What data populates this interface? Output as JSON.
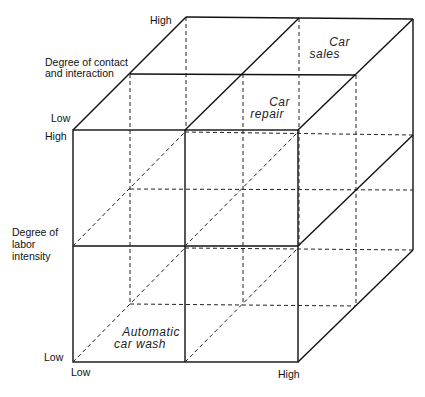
{
  "diagram": {
    "type": "3d-cube-matrix",
    "axes": {
      "depth": {
        "title": "Degree of contact\nand interaction",
        "title_line1": "Degree of contact",
        "title_line2": "and interaction",
        "low": "Low",
        "high": "High"
      },
      "vertical": {
        "title_line1": "Degree of",
        "title_line2": "labor",
        "title_line3": "intensity",
        "low": "Low",
        "high": "High"
      },
      "horizontal": {
        "low": "Low",
        "high": "High"
      }
    },
    "cells": {
      "car_sales": {
        "line1": "Car",
        "line2": "sales"
      },
      "car_repair": {
        "line1": "Car",
        "line2": "repair"
      },
      "automatic_car_wash": {
        "line1": "Automatic",
        "line2": "car wash"
      }
    }
  }
}
